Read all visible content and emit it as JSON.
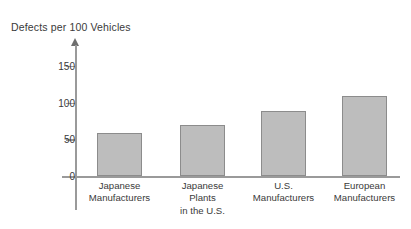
{
  "chart_data": {
    "type": "bar",
    "title": "Defects per 100 Vehicles",
    "xlabel": "",
    "ylabel": "",
    "ylim": [
      0,
      175
    ],
    "yticks": [
      0,
      50,
      100,
      150
    ],
    "ytick_labels": [
      "0",
      "50",
      "100",
      "150"
    ],
    "grid": false,
    "legend": false,
    "axis_style": "arrow-headed vertical axis, horizontal baseline",
    "categories": [
      "Japanese\nManufacturers",
      "Japanese\nPlants\nin the U.S.",
      "U.S.\nManufacturers",
      "European\nManufacturers"
    ],
    "values": [
      59,
      69,
      88,
      109
    ],
    "bar_color": "#bdbdbd",
    "bar_border_color": "#8c8c8c",
    "axis_color": "#9a9a9a",
    "text_color": "#3a3a3a"
  },
  "ticks": [
    {
      "label": "150",
      "value": 150
    },
    {
      "label": "100",
      "value": 100
    },
    {
      "label": "50",
      "value": 50
    },
    {
      "label": "0",
      "value": 0
    }
  ],
  "bars": [
    {
      "label": "Japanese\nManufacturers",
      "value": 59
    },
    {
      "label": "Japanese\nPlants\nin the U.S.",
      "value": 69
    },
    {
      "label": "U.S.\nManufacturers",
      "value": 88
    },
    {
      "label": "European\nManufacturers",
      "value": 109
    }
  ]
}
